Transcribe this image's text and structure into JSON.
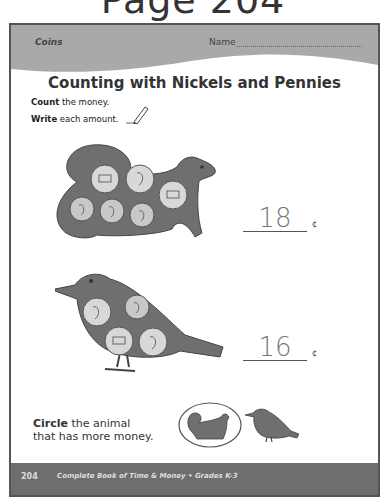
{
  "page_heading": "Page 204",
  "header": {
    "subject": "Coins",
    "name_label": "Name"
  },
  "title": "Counting with Nickels and Pennies",
  "instructions": [
    {
      "bold": "Count",
      "rest": " the money."
    },
    {
      "bold": "Write",
      "rest": " each amount."
    }
  ],
  "problems": [
    {
      "animal": "squirrel",
      "coins": [
        "nickel-back",
        "nickel-front",
        "nickel-back",
        "penny",
        "penny",
        "penny"
      ],
      "answer": "18",
      "unit": "¢"
    },
    {
      "animal": "bird",
      "coins": [
        "nickel-front",
        "penny",
        "nickel-back",
        "nickel-front"
      ],
      "answer": "16",
      "unit": "¢"
    }
  ],
  "circle_question": {
    "bold": "Circle",
    "line1_rest": " the animal",
    "line2": "that has more money.",
    "options": [
      "squirrel",
      "bird"
    ],
    "circled": "squirrel"
  },
  "footer": {
    "page_number": "204",
    "book_title": "Complete Book of Time & Money  •  Grades K-3"
  },
  "colors": {
    "banner": "#a9a9a9",
    "animal_fill": "#6f6f6f",
    "coin_fill": "#d8d8d8",
    "footer": "#6e6e6e"
  }
}
